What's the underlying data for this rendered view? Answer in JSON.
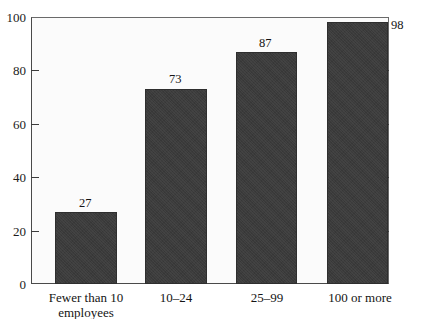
{
  "chart_data": {
    "type": "bar",
    "title": "",
    "subtitle": "",
    "xlabel": "",
    "ylabel": "",
    "categories": [
      "Fewer than 10\nemployees",
      "10–24",
      "25–99",
      "100 or more"
    ],
    "values": [
      27,
      73,
      87,
      98
    ],
    "value_labels": [
      "27",
      "73",
      "87",
      "98"
    ],
    "ylim": [
      0,
      100
    ],
    "yticks": [
      0,
      20,
      40,
      60,
      80,
      100
    ],
    "ytick_labels": [
      "0",
      "20",
      "40",
      "60",
      "80",
      "100"
    ],
    "grid": false,
    "legend": null,
    "bar_color": "#3b3b3b",
    "axis_color": "#3c3c3c",
    "plot_background": "#fbfbfb"
  }
}
